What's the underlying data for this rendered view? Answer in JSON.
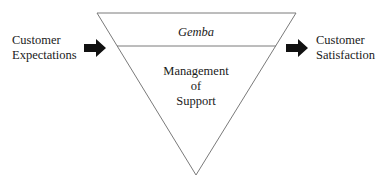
{
  "diagram": {
    "type": "inverted-triangle-flow",
    "input_label": [
      "Customer",
      "Expectations"
    ],
    "output_label": [
      "Customer",
      "Satisfaction"
    ],
    "triangle": {
      "top_section_label": "Gemba",
      "bottom_section_label": [
        "Management",
        "of",
        "Support"
      ]
    },
    "colors": {
      "line": "#7a7a7a",
      "arrow": "#111111",
      "text": "#1a1a1a"
    }
  }
}
